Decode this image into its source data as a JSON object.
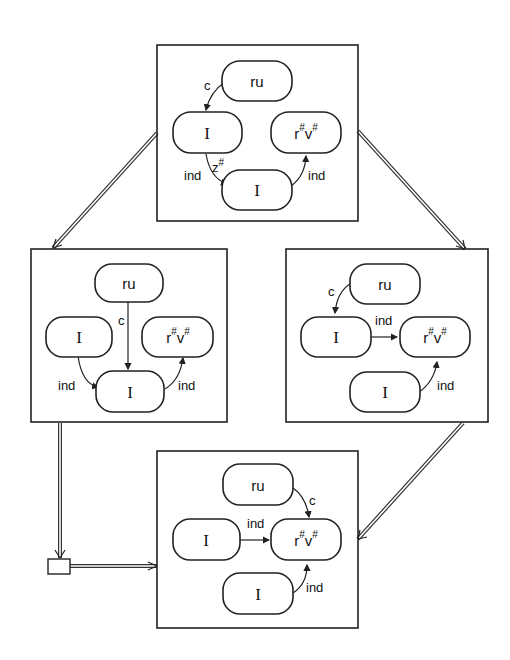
{
  "diagram": {
    "type": "state-transition lattice",
    "panels": [
      {
        "id": "top",
        "nodes": [
          {
            "id": "ru",
            "label": "ru"
          },
          {
            "id": "I1",
            "label": "I"
          },
          {
            "id": "rv",
            "label": "r",
            "label2": "v",
            "sup": "#"
          },
          {
            "id": "I2",
            "label": "I"
          }
        ],
        "edges": [
          {
            "from": "ru",
            "to": "I1",
            "label": "c"
          },
          {
            "from": "I1",
            "to": "I2",
            "label": "ind",
            "extra_label": "z",
            "extra_sup": "#"
          },
          {
            "from": "I2",
            "to": "rv",
            "label": "ind"
          }
        ]
      },
      {
        "id": "middle-left",
        "nodes": [
          {
            "id": "ru",
            "label": "ru"
          },
          {
            "id": "I1",
            "label": "I"
          },
          {
            "id": "rv",
            "label": "r",
            "label2": "v",
            "sup": "#"
          },
          {
            "id": "I2",
            "label": "I"
          }
        ],
        "edges": [
          {
            "from": "ru",
            "to": "I2",
            "label": "c"
          },
          {
            "from": "I1",
            "to": "I2",
            "label": "ind"
          },
          {
            "from": "I2",
            "to": "rv",
            "label": "ind"
          }
        ]
      },
      {
        "id": "middle-right",
        "nodes": [
          {
            "id": "ru",
            "label": "ru"
          },
          {
            "id": "I1",
            "label": "I"
          },
          {
            "id": "rv",
            "label": "r",
            "label2": "v",
            "sup": "#"
          },
          {
            "id": "I2",
            "label": "I"
          }
        ],
        "edges": [
          {
            "from": "ru",
            "to": "I1",
            "label": "c"
          },
          {
            "from": "I1",
            "to": "rv",
            "label": "ind"
          },
          {
            "from": "I2",
            "to": "rv",
            "label": "ind"
          }
        ]
      },
      {
        "id": "bottom",
        "nodes": [
          {
            "id": "ru",
            "label": "ru"
          },
          {
            "id": "I1",
            "label": "I"
          },
          {
            "id": "rv",
            "label": "r",
            "label2": "v",
            "sup": "#"
          },
          {
            "id": "I2",
            "label": "I"
          }
        ],
        "edges": [
          {
            "from": "ru",
            "to": "rv",
            "label": "c"
          },
          {
            "from": "I1",
            "to": "rv",
            "label": "ind"
          },
          {
            "from": "I2",
            "to": "rv",
            "label": "ind"
          }
        ]
      }
    ],
    "transitions": [
      {
        "from": "top",
        "to": "middle-left"
      },
      {
        "from": "top",
        "to": "middle-right"
      },
      {
        "from": "middle-right",
        "to": "bottom"
      },
      {
        "from": "middle-left",
        "to": "bottom",
        "via": "junction-box"
      }
    ]
  }
}
